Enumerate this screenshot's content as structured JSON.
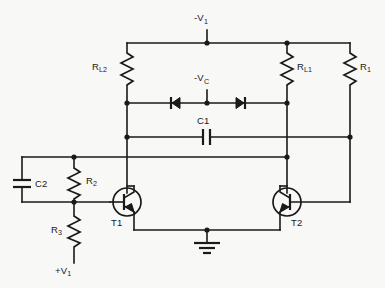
{
  "diagram": {
    "background_color": "#f8f8f6",
    "line_color": "#1a1a1a",
    "labels": {
      "supply_negative_v1": "-V",
      "supply_negative_v1_sub": "1",
      "clamp_negative_vc": "-V",
      "clamp_negative_vc_sub": "C",
      "supply_positive_v1": "+V",
      "supply_positive_v1_sub": "1",
      "resistor_rl2": "R",
      "resistor_rl2_sub": "L2",
      "resistor_rl1": "R",
      "resistor_rl1_sub": "L1",
      "resistor_ri": "R",
      "resistor_ri_sub": "1",
      "resistor_r2": "R",
      "resistor_r2_sub": "2",
      "resistor_r3": "R",
      "resistor_r3_sub": "3",
      "capacitor_c1": "C1",
      "capacitor_c2": "C2",
      "transistor_t1": "T1",
      "transistor_t2": "T2"
    },
    "components": [
      {
        "id": "RL2",
        "type": "resistor",
        "label": "R_L2"
      },
      {
        "id": "RL1",
        "type": "resistor",
        "label": "R_L1"
      },
      {
        "id": "Ri",
        "type": "resistor",
        "label": "R_1"
      },
      {
        "id": "R2",
        "type": "resistor",
        "label": "R_2"
      },
      {
        "id": "R3",
        "type": "resistor",
        "label": "R_3"
      },
      {
        "id": "C1",
        "type": "capacitor",
        "label": "C1"
      },
      {
        "id": "C2",
        "type": "capacitor",
        "label": "C2"
      },
      {
        "id": "D1",
        "type": "diode",
        "orientation": "cathode-left"
      },
      {
        "id": "D2",
        "type": "diode",
        "orientation": "cathode-right"
      },
      {
        "id": "T1",
        "type": "transistor-pnp",
        "label": "T1"
      },
      {
        "id": "T2",
        "type": "transistor-pnp",
        "label": "T2"
      },
      {
        "id": "GND",
        "type": "ground"
      }
    ]
  }
}
